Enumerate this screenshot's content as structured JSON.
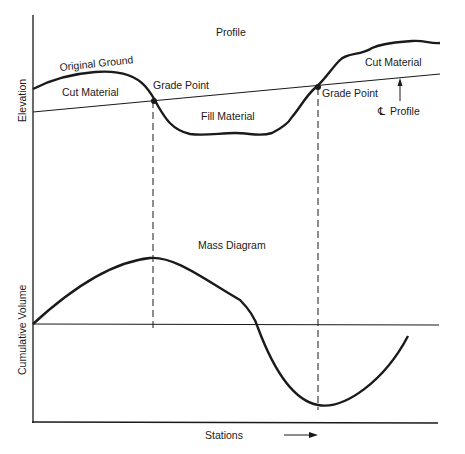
{
  "profile": {
    "title": "Profile",
    "y_axis_label": "Elevation",
    "original_ground_label": "Original Ground",
    "cut_material_left_label": "Cut Material",
    "fill_material_label": "Fill Material",
    "cut_material_right_label": "Cut Material",
    "grade_point_left_label": "Grade Point",
    "grade_point_right_label": "Grade Point",
    "cl_symbol": "℄",
    "cl_profile_label": "Profile"
  },
  "mass_diagram": {
    "title": "Mass Diagram",
    "y_axis_label": "Cumulative Volume",
    "x_axis_label": "Stations"
  },
  "colors": {
    "line": "#1a1a1a",
    "background": "#ffffff"
  }
}
